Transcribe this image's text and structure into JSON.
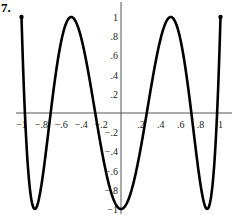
{
  "problem_number": "7.",
  "chart_data": {
    "type": "line",
    "title": "",
    "xlabel": "",
    "ylabel": "",
    "xlim": [
      -1,
      1
    ],
    "ylim": [
      -1,
      1
    ],
    "grid": false,
    "legend": null,
    "x_ticks": [
      -1,
      -0.8,
      -0.6,
      -0.4,
      -0.2,
      0.2,
      0.4,
      0.6,
      0.8,
      1
    ],
    "x_tick_labels": [
      "−1",
      "−.8",
      "−.6",
      "−.4",
      "−.2",
      ".2",
      ".4",
      ".6",
      ".8",
      "1"
    ],
    "y_ticks": [
      1,
      0.8,
      0.6,
      0.4,
      0.2,
      -0.2,
      -0.4,
      -0.6,
      -0.8,
      -1
    ],
    "y_tick_labels": [
      "1",
      ".8",
      ".6",
      ".4",
      ".2",
      "−.2",
      "−.4",
      "−.6",
      "−.8",
      "−1"
    ],
    "series": [
      {
        "name": "y = T6(x) = 32x^6 - 48x^4 + 18x^2 - 1",
        "x": [
          -1,
          -0.866,
          -0.707,
          -0.5,
          -0.259,
          0,
          0.259,
          0.5,
          0.707,
          0.866,
          1
        ],
        "values": [
          1,
          -1,
          0,
          1,
          0,
          -1,
          0,
          1,
          0,
          -1,
          1
        ],
        "endpoints_marked": true
      }
    ]
  }
}
